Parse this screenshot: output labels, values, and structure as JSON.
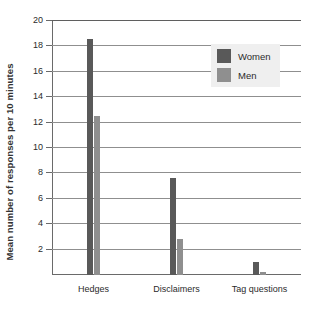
{
  "chart_data": {
    "type": "bar",
    "title": "",
    "xlabel": "",
    "ylabel": "Mean number of responses per 10 minutes",
    "categories": [
      "Hedges",
      "Disclaimers",
      "Tag questions"
    ],
    "series": [
      {
        "name": "Women",
        "color": "#595959",
        "values": [
          18.6,
          7.6,
          1.0
        ]
      },
      {
        "name": "Men",
        "color": "#8f8f8f",
        "values": [
          12.5,
          2.8,
          0.25
        ]
      }
    ],
    "ylim": [
      0,
      20
    ],
    "yticks": [
      2,
      4,
      6,
      8,
      10,
      12,
      14,
      16,
      18,
      20
    ],
    "ytick_labels": [
      "2",
      "4",
      "6",
      "8",
      "10",
      "12",
      "14",
      "16",
      "18",
      "20"
    ],
    "grid": true,
    "legend_position": "top-right",
    "legend_entries": [
      "Women",
      "Men"
    ]
  },
  "axis": {
    "y_title": "Mean number of responses per 10 minutes"
  }
}
